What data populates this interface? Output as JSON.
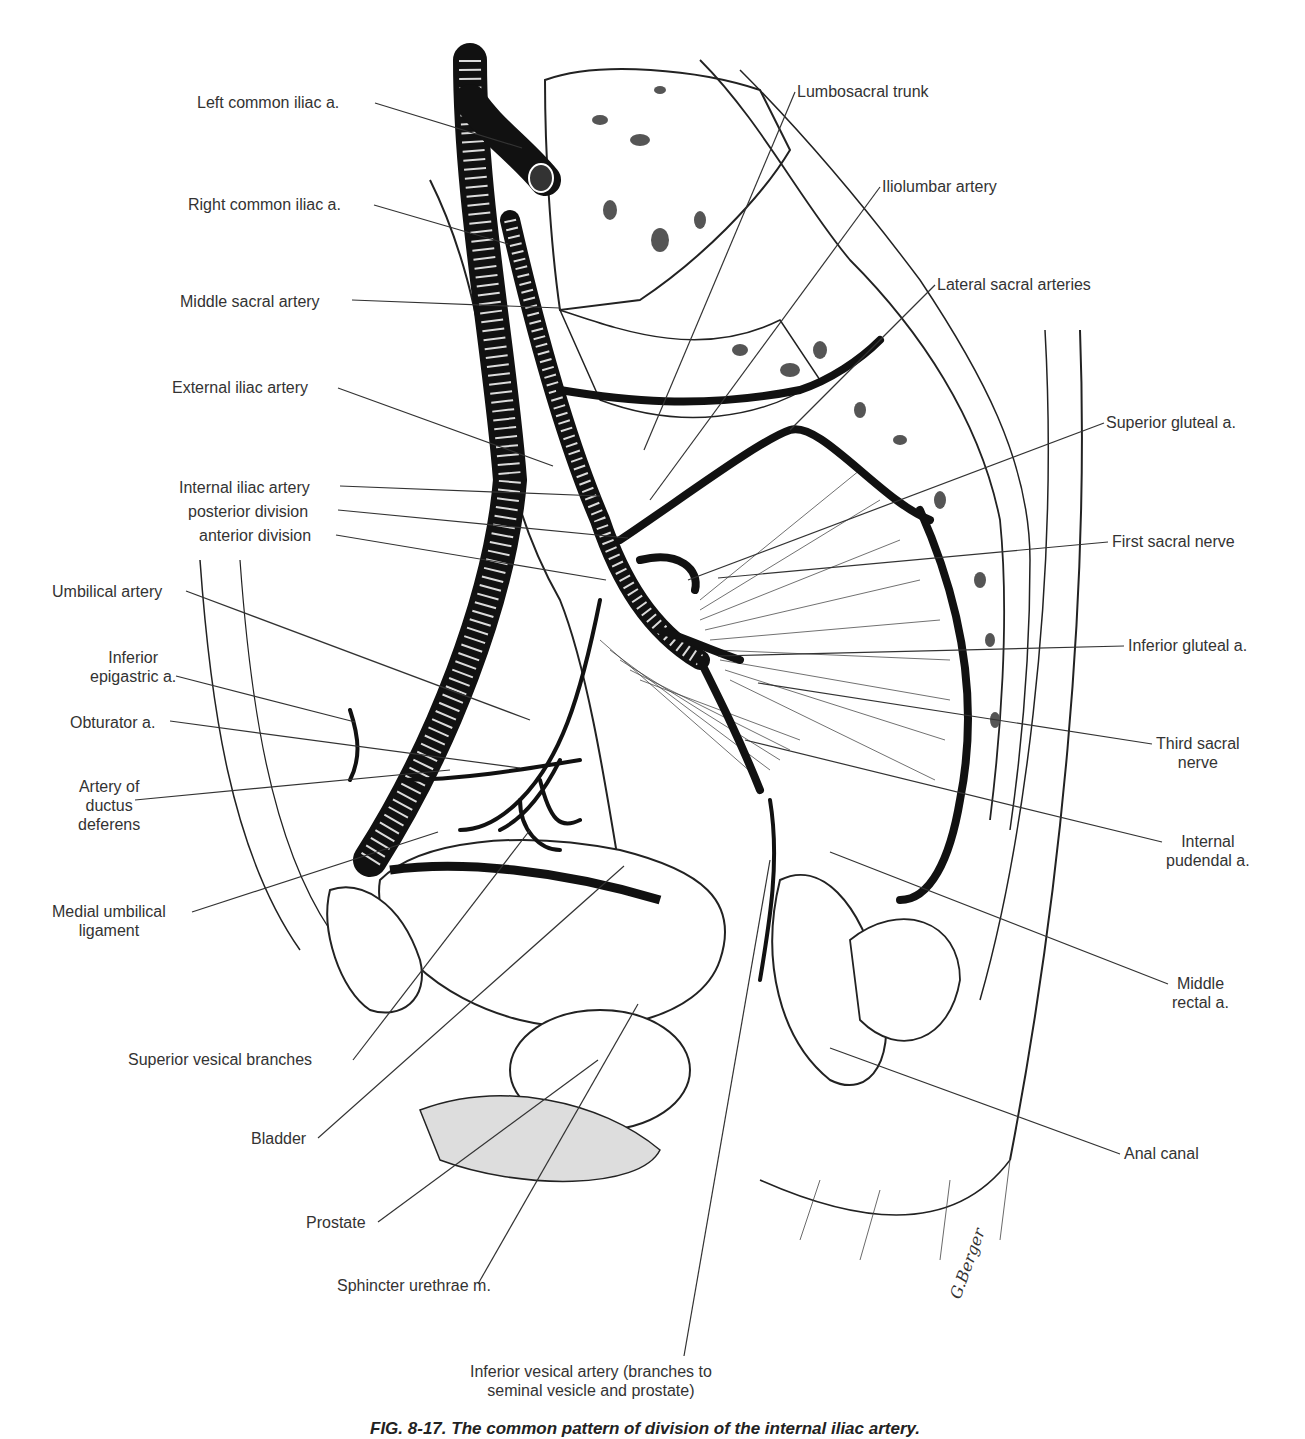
{
  "figure": {
    "caption": "FIG. 8-17. The common pattern of division of the internal iliac artery.",
    "signature": "G.Berger",
    "labels_left": [
      {
        "id": "left-common-iliac",
        "text": "Left common iliac a.",
        "x": 197,
        "y": 93
      },
      {
        "id": "right-common-iliac",
        "text": "Right common iliac a.",
        "x": 188,
        "y": 195
      },
      {
        "id": "middle-sacral",
        "text": "Middle sacral artery",
        "x": 180,
        "y": 292
      },
      {
        "id": "external-iliac",
        "text": "External iliac artery",
        "x": 172,
        "y": 378
      },
      {
        "id": "internal-iliac",
        "text": "Internal iliac artery",
        "x": 179,
        "y": 478
      },
      {
        "id": "posterior-division",
        "text": "posterior division",
        "x": 188,
        "y": 502
      },
      {
        "id": "anterior-division",
        "text": "anterior division",
        "x": 199,
        "y": 526
      },
      {
        "id": "umbilical-artery",
        "text": "Umbilical artery",
        "x": 52,
        "y": 582
      },
      {
        "id": "inferior-epigastric",
        "text": "Inferior\nepigastric a.",
        "x": 90,
        "y": 648
      },
      {
        "id": "obturator",
        "text": "Obturator a.",
        "x": 70,
        "y": 713
      },
      {
        "id": "artery-ductus-deferens",
        "text": "Artery of\nductus\ndeferens",
        "x": 78,
        "y": 777
      },
      {
        "id": "medial-umbilical-ligament",
        "text": "Medial umbilical\nligament",
        "x": 52,
        "y": 902
      },
      {
        "id": "superior-vesical",
        "text": "Superior vesical branches",
        "x": 128,
        "y": 1050
      },
      {
        "id": "bladder",
        "text": "Bladder",
        "x": 251,
        "y": 1129
      },
      {
        "id": "prostate",
        "text": "Prostate",
        "x": 306,
        "y": 1213
      },
      {
        "id": "sphincter-urethrae",
        "text": "Sphincter urethrae m.",
        "x": 337,
        "y": 1276
      },
      {
        "id": "inferior-vesical",
        "text": "Inferior vesical artery (branches to\nseminal vesicle and prostate)",
        "x": 470,
        "y": 1362
      }
    ],
    "labels_right": [
      {
        "id": "lumbosacral-trunk",
        "text": "Lumbosacral trunk",
        "x": 797,
        "y": 82
      },
      {
        "id": "iliolumbar",
        "text": "Iliolumbar artery",
        "x": 882,
        "y": 177
      },
      {
        "id": "lateral-sacral",
        "text": "Lateral sacral arteries",
        "x": 937,
        "y": 275
      },
      {
        "id": "superior-gluteal",
        "text": "Superior gluteal a.",
        "x": 1106,
        "y": 413
      },
      {
        "id": "first-sacral-nerve",
        "text": "First sacral nerve",
        "x": 1112,
        "y": 532
      },
      {
        "id": "inferior-gluteal",
        "text": "Inferior gluteal a.",
        "x": 1128,
        "y": 636
      },
      {
        "id": "third-sacral-nerve",
        "text": "Third sacral\nnerve",
        "x": 1156,
        "y": 734
      },
      {
        "id": "internal-pudendal",
        "text": "Internal\npudendal a.",
        "x": 1166,
        "y": 832
      },
      {
        "id": "middle-rectal",
        "text": "Middle\nrectal a.",
        "x": 1172,
        "y": 974
      },
      {
        "id": "anal-canal",
        "text": "Anal canal",
        "x": 1124,
        "y": 1144
      }
    ]
  }
}
